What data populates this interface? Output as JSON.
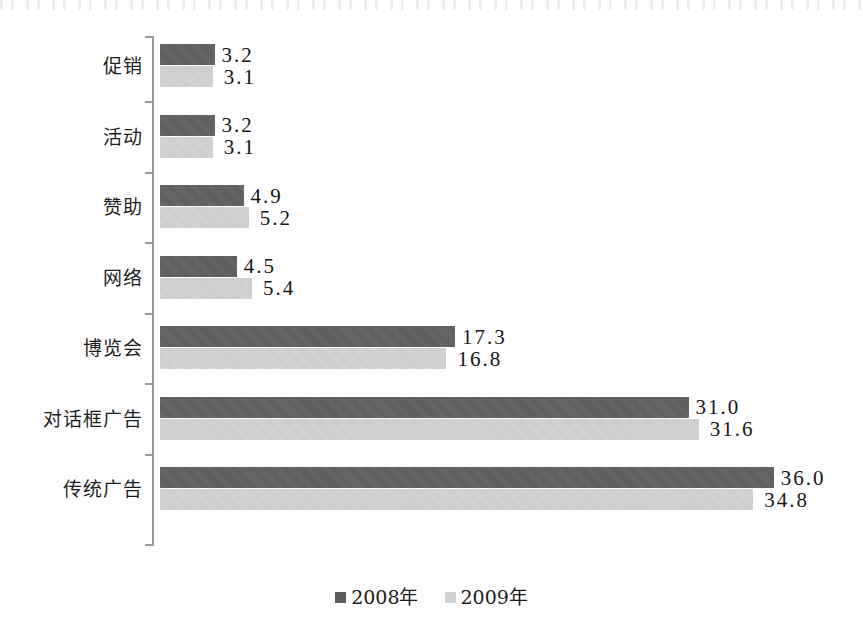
{
  "chart_data": {
    "type": "bar",
    "orientation": "horizontal",
    "title": "",
    "subtitle": "",
    "xlabel": "",
    "ylabel": "",
    "grid": false,
    "legend_position": "bottom-center",
    "xlim": [
      0,
      40
    ],
    "categories": [
      "促销",
      "活动",
      "赞助",
      "网络",
      "博览会",
      "对话框广告",
      "传统广告"
    ],
    "series": [
      {
        "name": "2008年",
        "color": "#5d5d5d",
        "values": [
          3.2,
          3.2,
          4.9,
          4.5,
          17.3,
          31.0,
          36.0
        ],
        "labels": [
          "3.2",
          "3.2",
          "4.9",
          "4.5",
          "17.3",
          "31.0",
          "36.0"
        ]
      },
      {
        "name": "2009年",
        "color": "#d0d0d0",
        "values": [
          3.1,
          3.1,
          5.2,
          5.4,
          16.8,
          31.6,
          34.8
        ],
        "labels": [
          "3.1",
          "3.1",
          "5.2",
          "5.4",
          "16.8",
          "31.6",
          "34.8"
        ]
      }
    ],
    "legend": [
      {
        "label": "2008年",
        "color": "#5d5d5d"
      },
      {
        "label": "2009年",
        "color": "#d0d0d0"
      }
    ],
    "axis": {
      "category_axis_color": "#9a9a9a",
      "ticks_between_categories": true
    }
  }
}
